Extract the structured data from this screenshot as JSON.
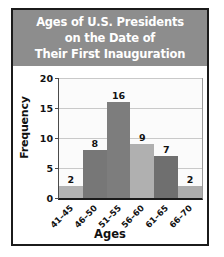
{
  "figure": {
    "title_lines": [
      "Ages of U.S. Presidents",
      "on the Date of",
      "Their First Inauguration"
    ],
    "title_bg": "#8d8d8d",
    "title_color": "#ffffff",
    "border_color": "#1b1b1b",
    "plot_bg": "#fbfbfb",
    "gridline_color": "#c9c9c9"
  },
  "chart_data": {
    "type": "bar",
    "title": "Ages of U.S. Presidents on the Date of Their First Inauguration",
    "categories": [
      "41–45",
      "46–50",
      "51–55",
      "56–60",
      "61–65",
      "66–70"
    ],
    "values": [
      2,
      8,
      16,
      9,
      7,
      2
    ],
    "bar_colors": [
      "#b3b3b3",
      "#777777",
      "#7d7d7d",
      "#b0b0b0",
      "#6f6f6f",
      "#adadad"
    ],
    "xlabel": "Ages",
    "ylabel": "Frequency",
    "ylim": [
      0,
      20
    ],
    "yticks": [
      0,
      5,
      10,
      15,
      20
    ],
    "ytick_labels": [
      "0",
      "5",
      "10",
      "15",
      "20"
    ],
    "grid": "horizontal",
    "legend": "none",
    "data_labels": [
      "2",
      "8",
      "16",
      "9",
      "7",
      "2"
    ]
  }
}
